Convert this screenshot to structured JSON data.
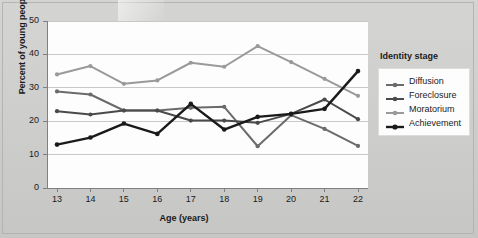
{
  "chart_data": {
    "type": "line",
    "title": "",
    "xlabel": "Age (years)",
    "ylabel": "Percent of young people",
    "legend_title": "Identity stage",
    "legend_position": "right",
    "grid": "horizontal",
    "x": [
      13,
      14,
      15,
      16,
      17,
      18,
      19,
      20,
      21,
      22
    ],
    "xtick_labels": [
      "13",
      "14",
      "15",
      "16",
      "17",
      "18",
      "19",
      "20",
      "21",
      "22"
    ],
    "ytick_labels": [
      "0",
      "10",
      "20",
      "30",
      "40",
      "50"
    ],
    "yticks": [
      0,
      10,
      20,
      30,
      40,
      50
    ],
    "xlim": [
      13,
      22
    ],
    "ylim": [
      0,
      50
    ],
    "series": [
      {
        "name": "Diffusion",
        "color": "#6b6b6b",
        "values": [
          28.9,
          28.0,
          23.2,
          23.2,
          24.0,
          24.3,
          12.5,
          21.8,
          17.7,
          12.6
        ]
      },
      {
        "name": "Foreclosure",
        "color": "#4a4a4a",
        "values": [
          23.0,
          22.0,
          23.2,
          23.2,
          20.2,
          20.2,
          19.5,
          22.2,
          26.5,
          20.6
        ]
      },
      {
        "name": "Moratorium",
        "color": "#9a9a9a",
        "values": [
          34.0,
          36.5,
          31.2,
          32.2,
          37.5,
          36.3,
          42.5,
          37.7,
          32.7,
          27.6
        ]
      },
      {
        "name": "Achievement",
        "color": "#1a1a1a",
        "values": [
          13.0,
          15.1,
          19.3,
          16.2,
          25.2,
          17.5,
          21.3,
          22.2,
          23.7,
          35.0
        ]
      }
    ]
  },
  "legend": {
    "title": "Identity stage",
    "items": [
      {
        "label": "Diffusion",
        "color": "#6b6b6b"
      },
      {
        "label": "Foreclosure",
        "color": "#4a4a4a"
      },
      {
        "label": "Moratorium",
        "color": "#9a9a9a"
      },
      {
        "label": "Achievement",
        "color": "#1a1a1a"
      }
    ]
  },
  "axes": {
    "x_title": "Age (years)",
    "y_title": "Percent of young people"
  }
}
